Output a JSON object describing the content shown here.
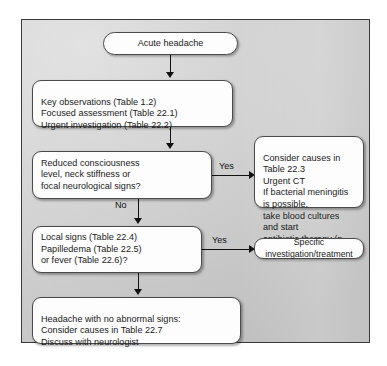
{
  "diagram": {
    "frame_border_color": "#3a3a3a",
    "box_fill_color": "#fdfdfd",
    "connector_color": "#111111",
    "nodes": {
      "start": {
        "label": "Acute headache",
        "shape": "rounded-pill"
      },
      "assessment": {
        "line1": "Key observations (Table 1.2)",
        "line2": "Focused assessment (Table 22.1)",
        "line3": "Urgent investigation (Table 22.2)",
        "text": "Key observations (Table 1.2)\nFocused assessment (Table 22.1)\nUrgent investigation (Table 22.2)"
      },
      "decision1": {
        "line1": "Reduced consciousness",
        "line2": "level, neck stiffness or",
        "line3": "focal neurological signs?",
        "text": "Reduced consciousness\nlevel, neck stiffness or\nfocal neurological signs?"
      },
      "outcome1": {
        "line1": "Consider causes in Table 22.3",
        "line2": "Urgent CT",
        "line3": "If bacterial meningitis is possible,",
        "line4": "take blood cultures and start",
        "line5": "antibiotic therapy (p. 329)",
        "text": "Consider causes in Table 22.3\nUrgent CT\nIf bacterial meningitis is possible,\ntake blood cultures and start\nantibiotic therapy (p. 329)"
      },
      "decision2": {
        "line1": "Local signs (Table 22.4)",
        "line2": "Papilledema (Table 22.5)",
        "line3": "or fever (Table 22.6)?",
        "text": "Local signs (Table 22.4)\nPapilledema (Table 22.5)\nor fever (Table 22.6)?"
      },
      "outcome2": {
        "label": "Specific investigation/treatment"
      },
      "final": {
        "line1": "Headache with no abnormal signs:",
        "line2": "Consider causes in Table 22.7",
        "line3": "Discuss with neurologist",
        "text": "Headache with no abnormal signs:\nConsider causes in Table 22.7\nDiscuss with neurologist"
      }
    },
    "branch_labels": {
      "yes_1": "Yes",
      "no_1": "No",
      "yes_2": "Yes"
    }
  }
}
